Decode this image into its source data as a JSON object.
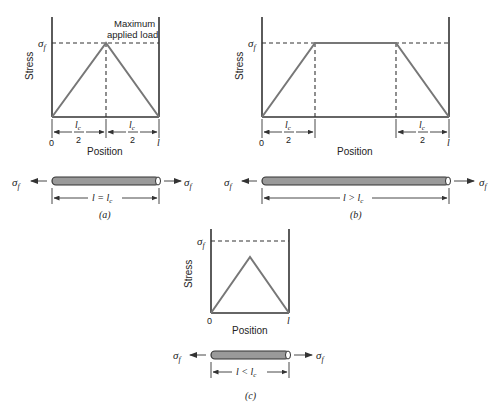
{
  "figure": {
    "y_axis_label": "Stress",
    "x_axis_label": "Position",
    "sigma_label": "σ",
    "sigma_sub": "f",
    "origin_label": "0",
    "end_label": "l",
    "half_lc_num": "l",
    "half_lc_num_sub": "c",
    "half_lc_den": "2",
    "annotation": [
      "Maximum",
      "applied load"
    ]
  },
  "panels": [
    {
      "id": "a",
      "caption": "(a)",
      "length_relation": "l = l",
      "length_sub": "c",
      "profile": "triangle-reaches-sigma_f"
    },
    {
      "id": "b",
      "caption": "(b)",
      "length_relation": "l > l",
      "length_sub": "c",
      "profile": "trapezoid-plateau-at-sigma_f"
    },
    {
      "id": "c",
      "caption": "(c)",
      "length_relation": "l < l",
      "length_sub": "c",
      "profile": "triangle-below-sigma_f"
    }
  ]
}
